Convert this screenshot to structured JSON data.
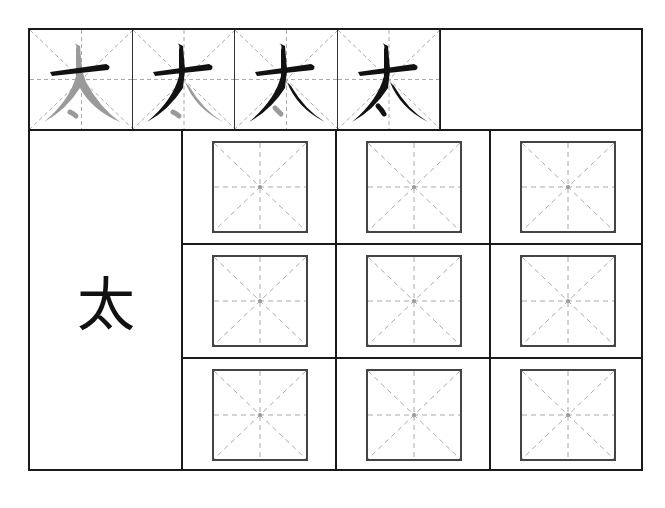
{
  "worksheet": {
    "character": "太",
    "stroke_order": {
      "steps": [
        {
          "step": 1,
          "label": "太",
          "highlight": "horizontal stroke"
        },
        {
          "step": 2,
          "label": "太",
          "highlight": "left-falling stroke"
        },
        {
          "step": 3,
          "label": "太",
          "highlight": "right-falling stroke"
        },
        {
          "step": 4,
          "label": "太",
          "highlight": "dot"
        }
      ]
    },
    "model_character": "太",
    "practice_grid": {
      "rows": 3,
      "columns": 3,
      "cell_type": "米字格"
    },
    "colors": {
      "ink": "#111111",
      "ghost": "#9a9a9a",
      "border": "#1a1a1a",
      "guide": "#a8a8a8"
    }
  }
}
